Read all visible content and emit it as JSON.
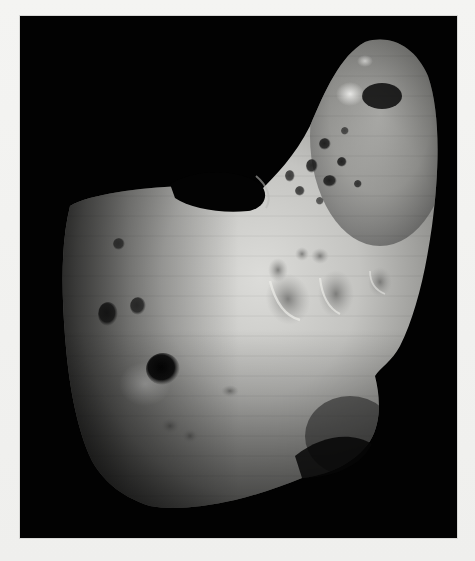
{
  "image": {
    "subject": "Asteroid photograph",
    "description": "Grayscale photograph of a peanut/saddle-shaped asteroid with cratered surface against a black space background",
    "background_color": "#020202",
    "page_color": "#f2f2f0",
    "surface_highlight_color": "#d9d9d6",
    "surface_mid_color": "#8a8a88",
    "surface_shadow_color": "#2a2a2a"
  },
  "caption": {
    "text": ""
  }
}
